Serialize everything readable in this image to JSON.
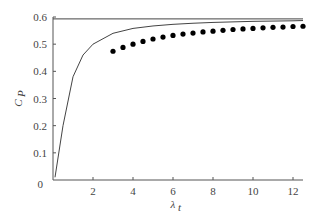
{
  "chart_data": {
    "type": "line",
    "title": "",
    "xlabel": "λ_t",
    "ylabel": "C_P",
    "xlim": [
      0,
      12.5
    ],
    "ylim": [
      0,
      0.6
    ],
    "x_ticks": [
      "2",
      "4",
      "6",
      "8",
      "10",
      "12"
    ],
    "y_ticks": [
      "0",
      "0.1",
      "0.2",
      "0.3",
      "0.4",
      "0.5",
      "0.6"
    ],
    "grid": false,
    "legend": null,
    "series": [
      {
        "name": "Betz limit",
        "style": "line",
        "x": [
          0,
          12.5
        ],
        "values": [
          0.593,
          0.593
        ]
      },
      {
        "name": "Ideal Cp curve",
        "style": "line",
        "x": [
          0.1,
          0.5,
          1,
          1.5,
          2,
          3,
          4,
          5,
          6,
          7,
          8,
          9,
          10,
          11,
          12,
          12.5
        ],
        "values": [
          0.01,
          0.2,
          0.38,
          0.46,
          0.5,
          0.54,
          0.558,
          0.567,
          0.573,
          0.577,
          0.58,
          0.582,
          0.584,
          0.585,
          0.586,
          0.587
        ]
      },
      {
        "name": "Data points",
        "style": "scatter",
        "x": [
          3,
          3.5,
          4,
          4.5,
          5,
          5.5,
          6,
          6.5,
          7,
          7.5,
          8,
          8.5,
          9,
          9.5,
          10,
          10.5,
          11,
          11.5,
          12,
          12.5
        ],
        "values": [
          0.474,
          0.488,
          0.5,
          0.51,
          0.519,
          0.526,
          0.532,
          0.537,
          0.541,
          0.545,
          0.548,
          0.551,
          0.554,
          0.556,
          0.558,
          0.56,
          0.562,
          0.563,
          0.565,
          0.566
        ]
      }
    ]
  }
}
